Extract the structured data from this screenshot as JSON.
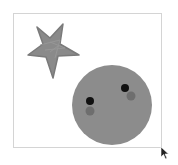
{
  "canvas": {
    "frame": {
      "x": 13,
      "y": 13,
      "width": 149,
      "height": 135,
      "border_color": "#d4d4d4"
    }
  },
  "shapes": {
    "star": {
      "fill": "#8a8a8a",
      "stroke": "#7a7a7a",
      "points": "37,27 50,38 63,24 60,44 79,55 58,56 53,78 46,57 28,55 43,44"
    },
    "circle": {
      "cx": 112,
      "cy": 105,
      "r": 40,
      "fill": "#8c8c8c"
    },
    "dots": [
      {
        "cx": 90,
        "cy": 101,
        "r": 4,
        "fill": "#111111"
      },
      {
        "cx": 90,
        "cy": 111,
        "r": 4.5,
        "fill": "#6e6e6e"
      },
      {
        "cx": 125,
        "cy": 88,
        "r": 4,
        "fill": "#111111"
      },
      {
        "cx": 131,
        "cy": 96,
        "r": 4.5,
        "fill": "#6e6e6e"
      }
    ]
  },
  "cursor": {
    "icon": "arrow-cursor-icon",
    "x": 160,
    "y": 146,
    "color": "#222222"
  }
}
